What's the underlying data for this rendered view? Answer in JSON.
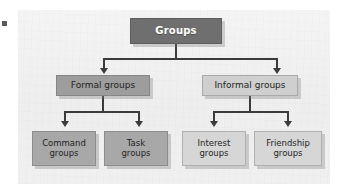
{
  "figure": {
    "type": "hierarchy-diagram",
    "orientation": "top-down",
    "root_label": "Groups",
    "levels": 3
  },
  "nodes": {
    "root": {
      "label": "Groups",
      "level": 1
    },
    "formal": {
      "label": "Formal groups",
      "level": 2
    },
    "informal": {
      "label": "Informal groups",
      "level": 2
    },
    "command": {
      "line1": "Command",
      "line2": "groups",
      "level": 3
    },
    "task": {
      "line1": "Task",
      "line2": "groups",
      "level": 3
    },
    "interest": {
      "line1": "Interest",
      "line2": "groups",
      "level": 3
    },
    "friendship": {
      "line1": "Friendship",
      "line2": "groups",
      "level": 3
    }
  },
  "colors": {
    "panel_background": "#f2f2f2",
    "root_fill": "#6f6f6f",
    "root_text": "#ffffff",
    "formal_fill": "#9d9d9d",
    "informal_fill": "#cfcfcf",
    "leaf_formal_fill": "#a8a8a8",
    "leaf_informal_fill": "#d6d6d6",
    "node_text": "#1f1f1f",
    "connector": "#3b3b3b",
    "border": "#8f8f8f"
  },
  "artifacts": {
    "watermark_left": "",
    "watermark_right": "",
    "edge_mark": ""
  }
}
